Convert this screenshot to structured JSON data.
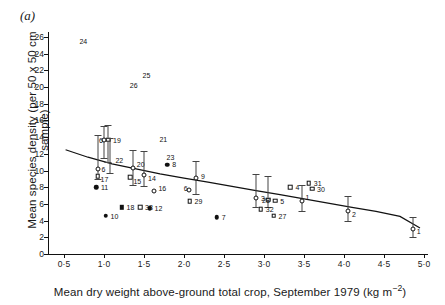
{
  "figure": {
    "panel_label": "(a)",
    "xlabel_main": "Mean dry weight above-ground total crop, September 1979 (kg m",
    "xlabel_sup": "−2",
    "xlabel_tail": ")",
    "ylabel": "Mean species density (per 50 x 50 cm sample)"
  },
  "chart_data": {
    "type": "scatter",
    "title": "(a)",
    "xlabel": "Mean dry weight above-ground total crop, September 1979 (kg m−2)",
    "ylabel": "Mean species density (per 50 x 50 cm sample)",
    "xlim": [
      0.3,
      5.05
    ],
    "ylim": [
      0,
      26.6
    ],
    "xticks": [
      0.5,
      1.0,
      1.5,
      2.0,
      2.5,
      3.0,
      3.5,
      4.0,
      4.5,
      5.0
    ],
    "xticklabels": [
      "0·5",
      "1·0",
      "1·5",
      "2·0",
      "2·5",
      "3·0",
      "3·5",
      "4·0",
      "4·5",
      "5·0"
    ],
    "yticks": [
      0,
      2,
      4,
      6,
      8,
      10,
      12,
      14,
      16,
      18,
      20,
      22,
      24,
      26
    ],
    "yticklabels": [
      "0",
      "2",
      "4",
      "6",
      "8",
      "10",
      "12",
      "14",
      "16",
      "18",
      "20",
      "22",
      "24",
      "26"
    ],
    "grid": false,
    "legend": null,
    "marker_types": [
      "filled-triangle",
      "filled-circle",
      "open-circle",
      "open-square",
      "filled-square"
    ],
    "fit_curve": {
      "description": "fitted declining curve through the scatter",
      "x": [
        0.52,
        0.8,
        1.1,
        1.4,
        1.7,
        2.0,
        2.3,
        2.6,
        2.9,
        3.2,
        3.5,
        3.8,
        4.1,
        4.4,
        4.7,
        4.95
      ],
      "y": [
        12.5,
        11.6,
        10.8,
        10.2,
        9.6,
        9.1,
        8.6,
        8.1,
        7.6,
        7.1,
        6.6,
        6.1,
        5.6,
        5.1,
        4.5,
        3.1
      ]
    },
    "points": [
      {
        "label": "24",
        "x": 0.63,
        "y": 25.5,
        "marker": "filled-triangle",
        "lx": 5,
        "ly": 0
      },
      {
        "label": "25",
        "x": 1.42,
        "y": 21.5,
        "marker": "filled-triangle",
        "lx": 5,
        "ly": 0
      },
      {
        "label": "26",
        "x": 1.26,
        "y": 20.3,
        "marker": "filled-triangle",
        "lx": 5,
        "ly": 0
      },
      {
        "label": "21",
        "x": 1.63,
        "y": 13.8,
        "marker": "filled-triangle",
        "lx": 5,
        "ly": 0
      },
      {
        "label": "23",
        "x": 1.72,
        "y": 11.6,
        "marker": "filled-triangle",
        "lx": 5,
        "ly": 0
      },
      {
        "label": "8",
        "x": 1.79,
        "y": 10.7,
        "marker": "filled-circle",
        "lx": 5,
        "ly": -1
      },
      {
        "label": "19",
        "x": 1.05,
        "y": 13.7,
        "marker": "open-square",
        "err": [
          11.0,
          15.4
        ],
        "lx": 5,
        "ly": 0
      },
      {
        "label": "6",
        "x": 1.0,
        "y": 13.7,
        "marker": "open-circle",
        "err": [
          11.5,
          15.3
        ],
        "lx": -5,
        "ly": 0
      },
      {
        "label": "22",
        "x": 1.08,
        "y": 11.3,
        "marker": "filled-triangle",
        "err": [
          9.7,
          13.9
        ],
        "lx": 5,
        "ly": 0
      },
      {
        "label": "6",
        "x": 0.92,
        "y": 10.2,
        "marker": "open-circle",
        "err": [
          9.0,
          14.2
        ],
        "lx": 4,
        "ly": 0
      },
      {
        "label": "17",
        "x": 0.92,
        "y": 9.3,
        "marker": "open-square",
        "lx": 3,
        "ly": 3
      },
      {
        "label": "11",
        "x": 0.9,
        "y": 8.0,
        "marker": "filled-circle",
        "lx": 5,
        "ly": 0
      },
      {
        "label": "10",
        "x": 1.02,
        "y": 4.6,
        "marker": "filled-circle",
        "lx": 5,
        "ly": 0
      },
      {
        "label": "18",
        "x": 1.22,
        "y": 5.6,
        "marker": "filled-square",
        "lx": 5,
        "ly": 0
      },
      {
        "label": "33",
        "x": 1.45,
        "y": 5.6,
        "marker": "open-square",
        "lx": 5,
        "ly": 0
      },
      {
        "label": "12",
        "x": 1.57,
        "y": 5.5,
        "marker": "filled-circle",
        "lx": 5,
        "ly": 0
      },
      {
        "label": "20",
        "x": 1.36,
        "y": 10.3,
        "marker": "open-circle",
        "err": [
          8.3,
          12.5
        ],
        "lx": 4,
        "ly": -4
      },
      {
        "label": "15",
        "x": 1.33,
        "y": 9.2,
        "marker": "open-square",
        "lx": 3,
        "ly": 4
      },
      {
        "label": "14",
        "x": 1.5,
        "y": 9.5,
        "marker": "open-circle",
        "err": [
          8.2,
          12.3
        ],
        "lx": 4,
        "ly": 3
      },
      {
        "label": "16",
        "x": 1.63,
        "y": 7.6,
        "marker": "open-circle",
        "lx": 4,
        "ly": -3
      },
      {
        "label": "9",
        "x": 2.15,
        "y": 9.1,
        "marker": "open-circle",
        "err": [
          7.2,
          11.2
        ],
        "lx": 5,
        "ly": -2
      },
      {
        "label": "6",
        "x": 2.06,
        "y": 7.7,
        "marker": "open-circle",
        "lx": -5,
        "ly": -2
      },
      {
        "label": "29",
        "x": 2.07,
        "y": 6.3,
        "marker": "open-square",
        "lx": 5,
        "ly": 0
      },
      {
        "label": "7",
        "x": 2.41,
        "y": 4.4,
        "marker": "filled-circle",
        "lx": 5,
        "ly": 0
      },
      {
        "label": "3",
        "x": 2.9,
        "y": 6.7,
        "marker": "open-circle",
        "err": [
          5.6,
          9.6
        ],
        "lx": 5,
        "ly": 0
      },
      {
        "label": "28",
        "x": 3.05,
        "y": 6.5,
        "marker": "open-square",
        "err": [
          5.6,
          9.3
        ],
        "lx": -6,
        "ly": 0
      },
      {
        "label": "5",
        "x": 3.14,
        "y": 6.4,
        "marker": "open-square",
        "lx": 5,
        "ly": 0
      },
      {
        "label": "32",
        "x": 2.96,
        "y": 5.4,
        "marker": "open-square",
        "lx": 5,
        "ly": 0
      },
      {
        "label": "27",
        "x": 3.12,
        "y": 4.6,
        "marker": "open-square",
        "lx": 5,
        "ly": 0
      },
      {
        "label": "4",
        "x": 3.33,
        "y": 8.0,
        "marker": "open-square",
        "lx": 5,
        "ly": 0
      },
      {
        "label": "31",
        "x": 3.56,
        "y": 8.5,
        "marker": "open-square",
        "lx": 5,
        "ly": 0
      },
      {
        "label": "30",
        "x": 3.6,
        "y": 7.8,
        "marker": "open-square",
        "lx": 5,
        "ly": 0
      },
      {
        "label": "1",
        "x": 3.47,
        "y": 6.4,
        "marker": "open-circle",
        "err": [
          5.2,
          8.3
        ],
        "lx": 4,
        "ly": -4
      },
      {
        "label": "2",
        "x": 4.05,
        "y": 5.1,
        "marker": "open-circle",
        "err": [
          4.0,
          7.0
        ],
        "lx": 4,
        "ly": 3
      },
      {
        "label": "1",
        "x": 4.86,
        "y": 3.0,
        "marker": "open-circle",
        "err": [
          2.0,
          4.4
        ],
        "lx": 4,
        "ly": 2
      }
    ]
  }
}
